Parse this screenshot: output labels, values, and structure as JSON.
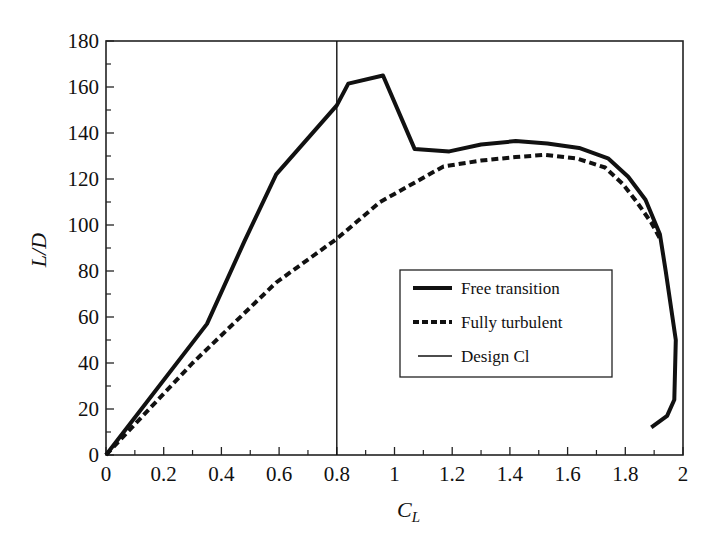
{
  "chart_data": {
    "type": "line",
    "title": "",
    "xlabel": "C_L",
    "xlabel_main": "C",
    "xlabel_sub": "L",
    "ylabel": "L/D",
    "xlim": [
      0,
      2
    ],
    "ylim": [
      0,
      180
    ],
    "grid": false,
    "legend_position": "center-right (inside plot)",
    "x_ticks": [
      "0",
      "0.2",
      "0.4",
      "0.6",
      "0.8",
      "1",
      "1.2",
      "1.4",
      "1.6",
      "1.8",
      "2"
    ],
    "y_ticks": [
      "0",
      "20",
      "40",
      "60",
      "80",
      "100",
      "120",
      "140",
      "160",
      "180"
    ],
    "series": [
      {
        "name": "Free transition",
        "style": "solid-thick",
        "color": "#111111",
        "points": [
          [
            0,
            0
          ],
          [
            0.35,
            57
          ],
          [
            0.48,
            93
          ],
          [
            0.59,
            122
          ],
          [
            0.8,
            152
          ],
          [
            0.84,
            161.5
          ],
          [
            0.96,
            165
          ],
          [
            1.07,
            133
          ],
          [
            1.19,
            132
          ],
          [
            1.3,
            135
          ],
          [
            1.42,
            136.5
          ],
          [
            1.53,
            135.5
          ],
          [
            1.64,
            133.5
          ],
          [
            1.74,
            129
          ],
          [
            1.81,
            121
          ],
          [
            1.87,
            111
          ],
          [
            1.92,
            96
          ],
          [
            1.94,
            80
          ],
          [
            1.975,
            50
          ],
          [
            1.97,
            24
          ],
          [
            1.945,
            17
          ],
          [
            1.89,
            12
          ]
        ]
      },
      {
        "name": "Fully turbulent",
        "style": "dashed-thick",
        "color": "#111111",
        "points": [
          [
            0,
            0
          ],
          [
            0.3,
            40
          ],
          [
            0.59,
            75
          ],
          [
            0.8,
            94
          ],
          [
            0.95,
            110
          ],
          [
            1.17,
            125.5
          ],
          [
            1.3,
            128
          ],
          [
            1.42,
            129.5
          ],
          [
            1.52,
            130.5
          ],
          [
            1.63,
            129
          ],
          [
            1.73,
            125
          ],
          [
            1.79,
            118
          ],
          [
            1.84,
            110
          ],
          [
            1.89,
            101
          ],
          [
            1.925,
            93
          ]
        ]
      },
      {
        "name": "Design Cl",
        "style": "solid-thin",
        "color": "#111111",
        "points": [
          [
            0.8,
            0
          ],
          [
            0.8,
            180
          ]
        ]
      }
    ],
    "legend": [
      {
        "label": "Free transition",
        "style": "solid-thick"
      },
      {
        "label": "Fully turbulent",
        "style": "dashed-thick"
      },
      {
        "label": "Design Cl",
        "style": "solid-thin"
      }
    ]
  }
}
